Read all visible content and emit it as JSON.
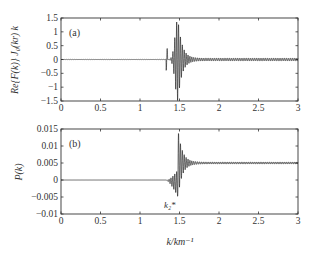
{
  "chart_data": [
    {
      "type": "line",
      "panel_label": "(a)",
      "title": "",
      "xlabel": "",
      "ylabel": "Re{F(k)} J_0(kr) k",
      "xlim": [
        0,
        3
      ],
      "ylim": [
        -1.5,
        1.5
      ],
      "xticks": [
        0,
        0.5,
        1,
        1.5,
        2,
        2.5,
        3
      ],
      "xtick_labels": [
        "0",
        "0.5",
        "1",
        "1.5",
        "2",
        "2.5",
        "3"
      ],
      "yticks": [
        1.5,
        1,
        0.5,
        0,
        -0.5,
        -1,
        -1.5
      ],
      "ytick_labels": [
        "1.5",
        "1",
        "0.5",
        "0",
        "−0.5",
        "−1",
        "−1.5"
      ],
      "grid": false,
      "legend": null,
      "description": "Oscillatory signal ~0 for k<1.35, growing burst peaking near k≈1.48 with amplitude ≈1.5, then decaying oscillation tail ~0.05 to k=3",
      "series": [
        {
          "name": "Re{F(k)}J0(kr)k",
          "shape": {
            "baseline": 0,
            "onset_k": 1.33,
            "peak_k": 1.48,
            "peak_amplitude": 1.5,
            "rise_width": 0.05,
            "decay_rate": 9.0,
            "tail_amplitude": 0.05,
            "osc_period": 0.012,
            "asymmetry": 0
          }
        }
      ]
    },
    {
      "type": "line",
      "panel_label": "(b)",
      "title": "",
      "xlabel": "k/km^-1",
      "ylabel": "P(k)",
      "xlim": [
        0,
        3
      ],
      "ylim": [
        -0.01,
        0.015
      ],
      "xticks": [
        0,
        0.5,
        1,
        1.5,
        2,
        2.5,
        3
      ],
      "xtick_labels": [
        "0",
        "0.5",
        "1",
        "1.5",
        "2",
        "2.5",
        "3"
      ],
      "yticks": [
        0.015,
        0.01,
        0.005,
        0,
        -0.005,
        -0.01
      ],
      "ytick_labels": [
        "0.015",
        "0.01",
        "0.005",
        "0",
        "−0.005",
        "−0.01"
      ],
      "grid": false,
      "legend": null,
      "annotations": [
        {
          "text": "k*_2",
          "x": 1.47,
          "y": -0.009
        }
      ],
      "description": "Cumulative integral: 0 for k<1.33, oscillation dips to ≈-0.005 near k≈1.47, jumps to ≈+0.015 then settles at ≈0.005 for k>1.6",
      "series": [
        {
          "name": "P(k)",
          "shape": {
            "baseline_before": 0,
            "baseline_after": 0.005,
            "onset_k": 1.33,
            "step_k": 1.48,
            "max_value": 0.015,
            "min_value": -0.005,
            "decay_rate": 12.0,
            "osc_period": 0.012
          }
        }
      ]
    }
  ],
  "labels": {
    "panel_a": "(a)",
    "panel_b": "(b)",
    "ylabel_a": "Re{F(k)} J₀(kr) k",
    "ylabel_b": "P(k)",
    "xlabel": "k/km⁻¹",
    "annotation_k2": "k₂*"
  }
}
